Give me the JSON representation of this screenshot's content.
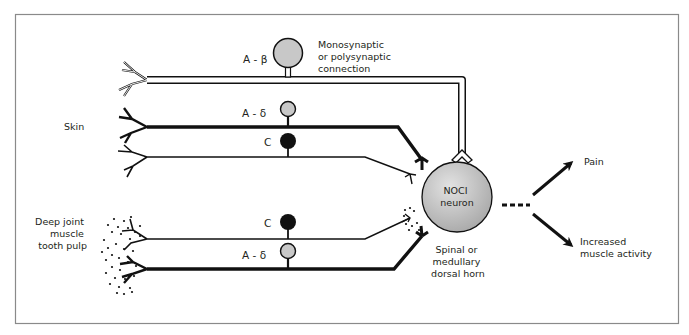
{
  "diagram": {
    "colors": {
      "ink": "#111111",
      "frame": "#8a8a8a",
      "soma_gray": "#c8c8c8",
      "soma_black": "#111111",
      "noci_fill": "#bdbdbd"
    },
    "regions": {
      "skin": "Skin",
      "deep": [
        "Deep joint",
        "muscle",
        "tooth pulp"
      ]
    },
    "fibers": {
      "a_beta": "A - β",
      "a_delta_skin": "A - δ",
      "c_skin": "C",
      "c_deep": "C",
      "a_delta_deep": "A - δ"
    },
    "connection_label": [
      "Monosynaptic",
      "or polysynaptic",
      "connection"
    ],
    "noci_neuron": [
      "NOCI",
      "neuron"
    ],
    "location_label": [
      "Spinal or",
      "medullary",
      "dorsal horn"
    ],
    "outputs": {
      "pain": "Pain",
      "muscle": [
        "Increased",
        "muscle activity"
      ]
    }
  }
}
